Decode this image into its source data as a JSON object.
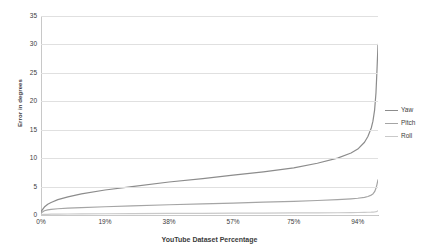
{
  "chart_data": {
    "type": "line",
    "title": "",
    "xlabel": "YouTube Dataset Percentage",
    "ylabel": "Error in degrees",
    "xlim": [
      0,
      100
    ],
    "ylim": [
      0,
      35
    ],
    "grid": true,
    "legend_position": "right",
    "x_tick_labels": [
      "0%",
      "19%",
      "38%",
      "57%",
      "75%",
      "94%"
    ],
    "x_tick_values": [
      0,
      19,
      38,
      57,
      75,
      94
    ],
    "y_tick_labels": [
      "0",
      "5",
      "10",
      "15",
      "20",
      "25",
      "30",
      "35"
    ],
    "y_tick_values": [
      0,
      5,
      10,
      15,
      20,
      25,
      30,
      35
    ],
    "x": [
      0,
      1,
      2,
      3,
      5,
      8,
      12,
      19,
      27,
      38,
      48,
      57,
      66,
      75,
      82,
      88,
      92,
      94,
      96,
      97,
      98,
      98.5,
      99,
      99.4,
      99.7,
      100
    ],
    "series": [
      {
        "name": "Yaw",
        "color": "#8c8c8c",
        "values": [
          0.6,
          1.4,
          1.9,
          2.2,
          2.7,
          3.2,
          3.7,
          4.4,
          5.0,
          5.8,
          6.4,
          7.0,
          7.6,
          8.3,
          9.1,
          10.0,
          10.9,
          11.6,
          12.8,
          13.8,
          15.3,
          16.5,
          18.5,
          21.5,
          25.5,
          30.0
        ]
      },
      {
        "name": "Pitch",
        "color": "#a5a5a5",
        "values": [
          0.35,
          0.75,
          0.9,
          1.0,
          1.1,
          1.2,
          1.3,
          1.45,
          1.6,
          1.8,
          1.95,
          2.1,
          2.25,
          2.4,
          2.55,
          2.7,
          2.85,
          2.95,
          3.1,
          3.25,
          3.5,
          3.7,
          4.1,
          4.7,
          5.4,
          6.2
        ]
      },
      {
        "name": "Roll",
        "color": "#c9c9c9",
        "values": [
          0.05,
          0.1,
          0.12,
          0.14,
          0.16,
          0.18,
          0.2,
          0.22,
          0.25,
          0.28,
          0.3,
          0.32,
          0.34,
          0.36,
          0.38,
          0.4,
          0.42,
          0.44,
          0.46,
          0.48,
          0.5,
          0.52,
          0.55,
          0.6,
          0.65,
          0.72
        ]
      }
    ],
    "legend": [
      {
        "label": "Yaw",
        "color": "#8c8c8c"
      },
      {
        "label": "Pitch",
        "color": "#a5a5a5"
      },
      {
        "label": "Roll",
        "color": "#c9c9c9"
      }
    ],
    "colors": {
      "gridline": "#e0e0e0",
      "axis": "#c8c8c8",
      "text": "#3c3c3c",
      "background": "#ffffff"
    }
  }
}
